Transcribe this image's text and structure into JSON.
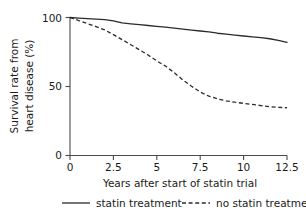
{
  "chart_data": {
    "type": "line",
    "title": "",
    "xlabel": "Years after start of statin trial",
    "ylabel": "Survival rate from heart disease (%)",
    "ylabel_line1": "Survival rate from",
    "ylabel_line2": "heart disease (%)",
    "xlim": [
      0,
      12.5
    ],
    "ylim": [
      0,
      100
    ],
    "grid": false,
    "legend_position": "bottom",
    "xticks": [
      0,
      2.5,
      5,
      7.5,
      10,
      12.5
    ],
    "xtick_labels": [
      "0",
      "2.5",
      "5",
      "7.5",
      "10",
      "12.5"
    ],
    "yticks": [
      0,
      50,
      100
    ],
    "ytick_labels": [
      "0",
      "50",
      "100"
    ],
    "x": [
      0,
      0.5,
      1,
      1.5,
      2,
      2.5,
      3,
      3.5,
      4,
      4.5,
      5,
      5.5,
      6,
      6.5,
      7,
      7.5,
      8,
      8.5,
      9,
      9.5,
      10,
      10.5,
      11,
      11.5,
      12,
      12.5
    ],
    "series": [
      {
        "name": "statin treatment",
        "style": "solid",
        "color": "#2b2b2b",
        "values": [
          100,
          99.6,
          99.2,
          98.8,
          98.4,
          97.6,
          96.1,
          95.4,
          94.8,
          94.2,
          93.6,
          93.0,
          92.3,
          91.6,
          90.9,
          90.2,
          89.6,
          88.6,
          87.9,
          87.2,
          86.6,
          86.0,
          85.4,
          84.6,
          83.4,
          82.0
        ]
      },
      {
        "name": "no statin treatment",
        "style": "dashed",
        "color": "#2b2b2b",
        "values": [
          100,
          97.8,
          95.6,
          93.4,
          91.0,
          87.6,
          84.0,
          80.3,
          76.6,
          72.8,
          68.5,
          64.8,
          60.0,
          54.8,
          50.2,
          46.0,
          43.0,
          41.0,
          39.6,
          38.6,
          37.8,
          37.0,
          36.2,
          35.4,
          34.9,
          34.6
        ]
      }
    ],
    "legend": [
      {
        "label": "statin treatment",
        "style": "solid"
      },
      {
        "label": "no statin treatment",
        "style": "dashed"
      }
    ]
  }
}
